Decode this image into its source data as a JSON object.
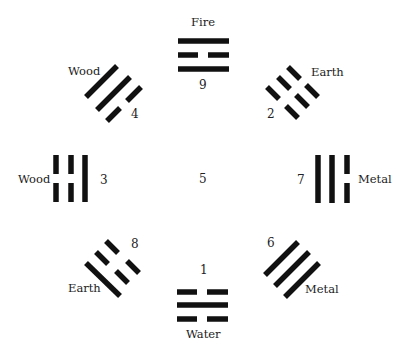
{
  "diagram": {
    "type": "bagua-lo-shu",
    "line_color": "#111111",
    "center": {
      "number": "5"
    },
    "trigrams": [
      {
        "position": "top",
        "element": "Fire",
        "number": "9",
        "lines": [
          "solid",
          "broken",
          "solid"
        ]
      },
      {
        "position": "top-right",
        "element": "Earth",
        "number": "2",
        "lines": [
          "broken",
          "broken",
          "broken"
        ]
      },
      {
        "position": "right",
        "element": "Metal",
        "number": "7",
        "lines": [
          "solid",
          "solid",
          "broken"
        ]
      },
      {
        "position": "bottom-right",
        "element": "Metal",
        "number": "6",
        "lines": [
          "solid",
          "solid",
          "solid"
        ]
      },
      {
        "position": "bottom",
        "element": "Water",
        "number": "1",
        "lines": [
          "broken",
          "solid",
          "broken"
        ]
      },
      {
        "position": "bottom-left",
        "element": "Earth",
        "number": "8",
        "lines": [
          "solid",
          "broken",
          "broken"
        ]
      },
      {
        "position": "left",
        "element": "Wood",
        "number": "3",
        "lines": [
          "broken",
          "broken",
          "solid"
        ]
      },
      {
        "position": "top-left",
        "element": "Wood",
        "number": "4",
        "lines": [
          "solid",
          "solid",
          "broken"
        ]
      }
    ]
  }
}
